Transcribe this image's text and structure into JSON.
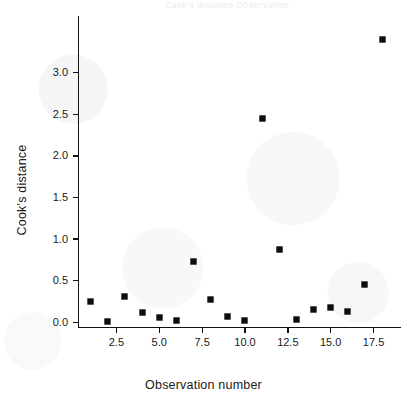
{
  "figure": {
    "background_color": "#ffffff",
    "marker_color": "#0d0d0d",
    "axis_color": "#111111",
    "faint_header_text": "Cook's distance    Observation",
    "title": ""
  },
  "chart_data": {
    "type": "scatter",
    "title": "",
    "subtitle": "",
    "xlabel": "Observation number",
    "ylabel": "Cook's distance",
    "x": [
      1,
      2,
      3,
      4,
      5,
      6,
      7,
      8,
      9,
      10,
      11,
      12,
      13,
      14,
      15,
      16,
      17,
      18
    ],
    "values": [
      0.25,
      0.01,
      0.31,
      0.12,
      0.06,
      0.02,
      0.73,
      0.28,
      0.07,
      0.02,
      2.45,
      0.88,
      0.03,
      0.15,
      0.18,
      0.13,
      0.45,
      3.4
    ],
    "series": [
      {
        "name": "Cook's distance",
        "marker": "square",
        "values": [
          0.25,
          0.01,
          0.31,
          0.12,
          0.06,
          0.02,
          0.73,
          0.28,
          0.07,
          0.02,
          2.45,
          0.88,
          0.03,
          0.15,
          0.18,
          0.13,
          0.45,
          3.4
        ]
      }
    ],
    "xlim": [
      0.3,
      19.1
    ],
    "ylim": [
      -0.06,
      3.68
    ],
    "xticks": [
      2.5,
      5.0,
      7.5,
      10.0,
      12.5,
      15.0,
      17.5
    ],
    "xtick_labels": [
      "2.5",
      "5.0",
      "7.5",
      "10.0",
      "12.5",
      "15.0",
      "17.5"
    ],
    "yticks": [
      0.0,
      0.5,
      1.0,
      1.5,
      2.0,
      2.5,
      3.0
    ],
    "ytick_labels": [
      "0.0",
      "0.5",
      "1.0",
      "1.5",
      "2.0",
      "2.5",
      "3.0"
    ],
    "grid": false,
    "legend": false,
    "legend_position": "none",
    "annotations": []
  }
}
